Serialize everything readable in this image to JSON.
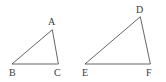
{
  "figure": {
    "type": "geometry-diagram",
    "background_color": "#ffffff",
    "stroke_color": "#555555",
    "label_color": "#3a3a3a",
    "canvas": {
      "width": 166,
      "height": 82
    },
    "triangles": [
      {
        "name": "triangle-abc",
        "vertices": [
          {
            "label": "A",
            "x": 52,
            "y": 30,
            "label_x": 48,
            "label_y": 25
          },
          {
            "label": "B",
            "x": 12,
            "y": 64,
            "label_x": 9,
            "label_y": 76
          },
          {
            "label": "C",
            "x": 58,
            "y": 64,
            "label_x": 54,
            "label_y": 76
          }
        ],
        "path": "M 52 30 L 12 64 L 58 64 Z"
      },
      {
        "name": "triangle-def",
        "vertices": [
          {
            "label": "D",
            "x": 140,
            "y": 17,
            "label_x": 136,
            "label_y": 13
          },
          {
            "label": "E",
            "x": 85,
            "y": 64,
            "label_x": 82,
            "label_y": 76
          },
          {
            "label": "F",
            "x": 150,
            "y": 64,
            "label_x": 146,
            "label_y": 76
          }
        ],
        "path": "M 140 17 L 85 64 L 150 64 Z"
      }
    ]
  }
}
